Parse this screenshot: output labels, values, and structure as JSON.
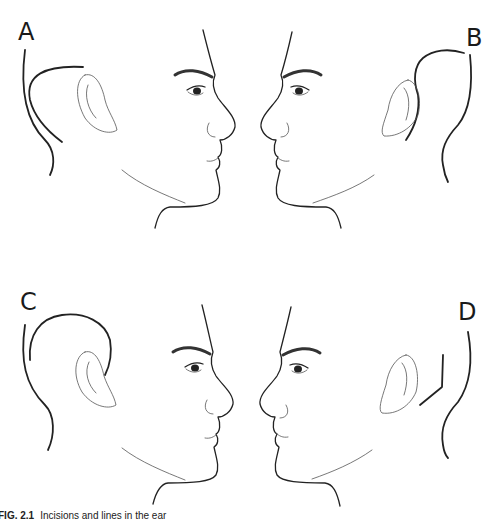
{
  "figure": {
    "panels": [
      {
        "label": "A",
        "facing": "right",
        "incision": "postauricular curved line behind ear"
      },
      {
        "label": "B",
        "facing": "left",
        "incision": "curved line behind ear extending up"
      },
      {
        "label": "C",
        "facing": "right",
        "incision": "arched line over ear"
      },
      {
        "label": "D",
        "facing": "left",
        "incision": "angled line behind ear"
      }
    ],
    "caption": {
      "number": "FIG. 2.1",
      "text": "Incisions and lines in the ear"
    }
  }
}
